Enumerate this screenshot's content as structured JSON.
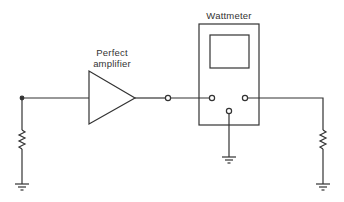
{
  "diagram": {
    "labels": {
      "amplifier_line1": "Perfect",
      "amplifier_line2": "amplifier",
      "wattmeter": "Wattmeter"
    },
    "components": [
      {
        "type": "resistor",
        "role": "source-resistance"
      },
      {
        "type": "amplifier",
        "name": "Perfect amplifier"
      },
      {
        "type": "terminal",
        "role": "amplifier-output"
      },
      {
        "type": "wattmeter",
        "name": "Wattmeter",
        "terminals": [
          "input",
          "output",
          "ground"
        ]
      },
      {
        "type": "resistor",
        "role": "load"
      },
      {
        "type": "ground",
        "count": 3
      }
    ],
    "colors": {
      "line": "#333333",
      "background": "#ffffff"
    }
  }
}
